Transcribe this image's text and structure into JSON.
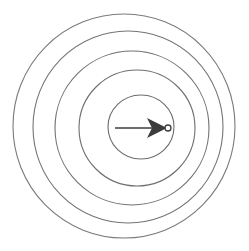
{
  "figure": {
    "title": "Concentric circles with radial arrow",
    "background_color": "#ffffff",
    "width": 249,
    "height": 251
  },
  "chart_data": {
    "type": "scatter",
    "title": "Concentric circles with radial arrow",
    "xlabel": "",
    "ylabel": "",
    "grid": false,
    "legend_position": "none",
    "stroke_color": "#6e6e6e",
    "arrow_color": "#3c3c3c",
    "center": {
      "x": 141,
      "y": 128
    },
    "rings": [
      {
        "name": "ring-1-outermost",
        "cx": 124,
        "cy": 126,
        "rx": 111,
        "ry": 112,
        "stroke": "#7a7a7a",
        "stroke_width": 1.1
      },
      {
        "name": "ring-2",
        "cx": 128,
        "cy": 127,
        "rx": 95,
        "ry": 96,
        "stroke": "#757575",
        "stroke_width": 1.1
      },
      {
        "name": "ring-3",
        "cx": 132,
        "cy": 128,
        "rx": 77,
        "ry": 77,
        "stroke": "#707070",
        "stroke_width": 1.1
      },
      {
        "name": "ring-4",
        "cx": 137,
        "cy": 128,
        "rx": 58,
        "ry": 58,
        "stroke": "#6e6e6e",
        "stroke_width": 1.1
      },
      {
        "name": "ring-5-innermost",
        "cx": 141,
        "cy": 127,
        "rx": 33,
        "ry": 32,
        "stroke": "#6b6b6b",
        "stroke_width": 1.1
      }
    ],
    "arrow": {
      "name": "radial-arrow",
      "tail_x": 115,
      "tail_y": 128,
      "tip_x": 167,
      "tip_y": 128,
      "shaft_width": 1.4,
      "head_length": 20,
      "head_half_width": 10,
      "head_notch": 5,
      "color": "#3c3c3c"
    },
    "center_marker": {
      "name": "center-point",
      "cx": 168,
      "cy": 128,
      "r": 3,
      "fill": "#ffffff",
      "stroke": "#3c3c3c",
      "stroke_width": 1.3
    },
    "ring_count": 5,
    "annotations": []
  }
}
